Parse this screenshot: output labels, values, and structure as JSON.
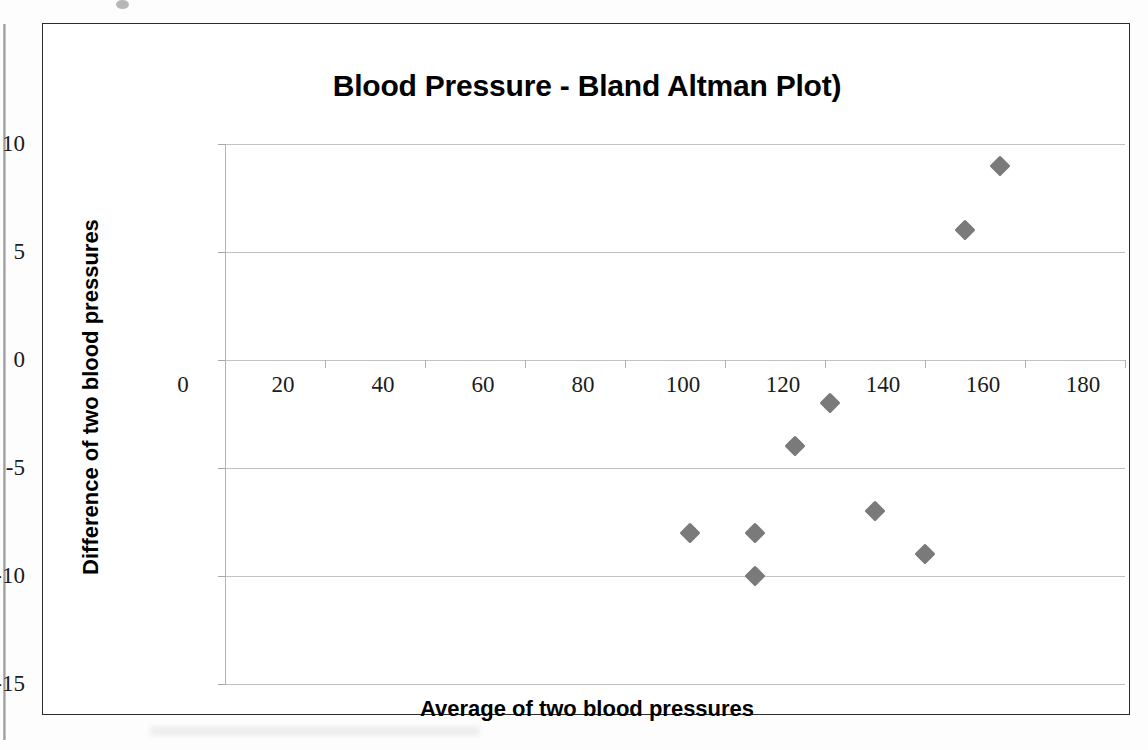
{
  "chart_data": {
    "type": "scatter",
    "title": "Blood Pressure - Bland Altman Plot)",
    "xlabel": "Average of two blood pressures",
    "ylabel": "Difference of two blood pressures",
    "xlim": [
      0,
      180
    ],
    "ylim": [
      -15,
      10
    ],
    "xticks": [
      0,
      20,
      40,
      60,
      80,
      100,
      120,
      140,
      160,
      180
    ],
    "yticks": [
      10,
      5,
      0,
      -5,
      -10,
      -15
    ],
    "xtick_labels": [
      "0",
      "20",
      "40",
      "60",
      "80",
      "100",
      "120",
      "140",
      "160",
      "180"
    ],
    "ytick_labels": [
      "10",
      "5",
      "0",
      "-5",
      "-10",
      "-15"
    ],
    "grid": "horizontal",
    "legend": "none",
    "series": [
      {
        "name": "Difference vs Average",
        "marker": "diamond",
        "color": "#7a7a7a",
        "points": [
          {
            "x": 93,
            "y": -8
          },
          {
            "x": 106,
            "y": -8
          },
          {
            "x": 106,
            "y": -10
          },
          {
            "x": 114,
            "y": -4
          },
          {
            "x": 121,
            "y": -2
          },
          {
            "x": 130,
            "y": -7
          },
          {
            "x": 140,
            "y": -9
          },
          {
            "x": 148,
            "y": 6
          },
          {
            "x": 155,
            "y": 9
          }
        ]
      }
    ]
  },
  "colors": {
    "marker": "#7a7a7a",
    "gridline": "#c2c2c2",
    "axis": "#b4b4b4",
    "frame": "#2c2c2c",
    "text": "#000000"
  }
}
